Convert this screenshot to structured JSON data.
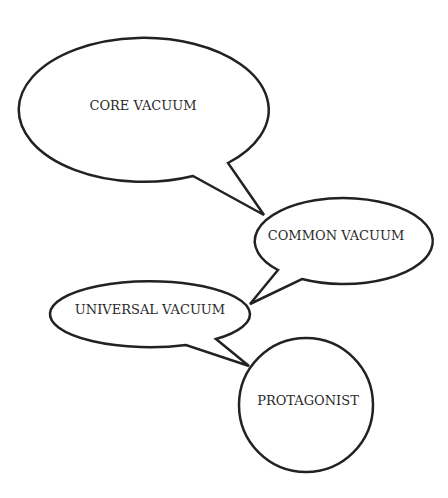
{
  "diagram": {
    "type": "speech-bubble chain",
    "nodes": [
      {
        "id": "core",
        "label": "CORE VACUUM",
        "shape": "speech-bubble-ellipse"
      },
      {
        "id": "common",
        "label": "COMMON VACUUM",
        "shape": "speech-bubble-ellipse"
      },
      {
        "id": "universal",
        "label": "UNIVERSAL VACUUM",
        "shape": "speech-bubble-ellipse"
      },
      {
        "id": "protagonist",
        "label": "PROTAGONIST",
        "shape": "circle"
      }
    ],
    "edges": [
      {
        "from": "core",
        "to": "common"
      },
      {
        "from": "common",
        "to": "universal"
      },
      {
        "from": "universal",
        "to": "protagonist"
      }
    ],
    "colors": {
      "stroke": "#222222",
      "fill": "#ffffff",
      "text": "#2a2a2a"
    }
  }
}
